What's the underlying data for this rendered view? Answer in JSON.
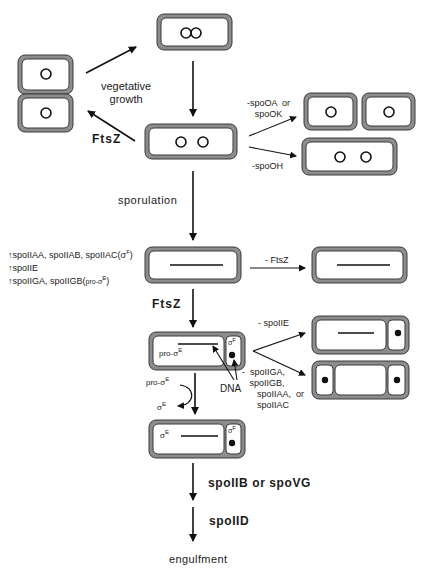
{
  "labels": {
    "vegetative_growth": "vegetative\ngrowth",
    "ftsz_top": "FtsZ",
    "sporulation": "sporulation",
    "spo0a_spo0k": "-spoOA  or\nspoOK",
    "spo0h": "-spoOH",
    "minus_ftsz": "-  FtsZ",
    "ftsz_middle": "FtsZ",
    "minus_spoiie": "-  spoIIE",
    "minus_spoiiga_group": "-  spoIIGA,\n   spoIIGB,\n      spoIIAA,  or\n      spoIIAC",
    "dna": "DNA",
    "pro_sigma_e_cell": "pro-σ",
    "pro_sigma_e_cell_sup": "E",
    "sigma_f": "σ",
    "sigma_f_sup": "F",
    "pro_sigma_e_arc": "pro-σ",
    "pro_sigma_e_arc_sup": "E",
    "sigma_e_arc": "σ",
    "sigma_e_arc_sup": "E",
    "sigma_e_cell": "σ",
    "sigma_e_cell_sup": "E",
    "sigma_f_bottom": "σ",
    "sigma_f_bottom_sup": "F",
    "spoiib_spovg": "spoIIB  or  spoVG",
    "spoiid": "spoIID",
    "engulfment": "engulfment"
  },
  "gene_list": [
    {
      "arrow": "↑",
      "text": "spoIIAA,  spoIIAB,  spoIIAC(",
      "sigma": "σ",
      "sup": "F",
      "close": ")"
    },
    {
      "arrow": "↑",
      "text": "spoIIE",
      "sigma": "",
      "sup": "",
      "close": ""
    },
    {
      "arrow": "↑",
      "text": "spoIIGA,  spoIIGB(",
      "sigma": "pro-σ",
      "sup": "E",
      "close": ")"
    }
  ],
  "colors": {
    "wall": "#8c8c8c",
    "wall_edge": "#3a3a3a",
    "ink": "#111111",
    "background": "#ffffff"
  }
}
